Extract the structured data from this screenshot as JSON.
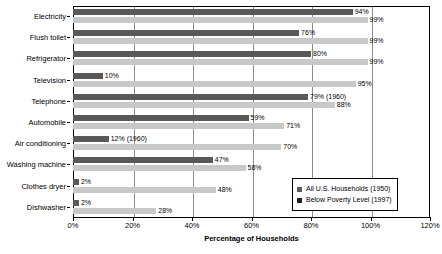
{
  "chart_data": {
    "type": "bar",
    "orientation": "horizontal",
    "title": "",
    "xlabel": "Percentage of Households",
    "ylabel": "",
    "xlim": [
      0,
      120
    ],
    "xticks": [
      "0%",
      "20%",
      "40%",
      "60%",
      "80%",
      "100%",
      "120%"
    ],
    "xtick_values": [
      0,
      20,
      40,
      60,
      80,
      100,
      120
    ],
    "grid": true,
    "legend_position": "bottom-right",
    "categories": [
      "Electricity",
      "Flush toilet",
      "Refrigerator",
      "Television",
      "Telephone",
      "Automobile",
      "Air conditioning",
      "Washing machine",
      "Clothes dryer",
      "Dishwasher"
    ],
    "series": [
      {
        "name": "All U.S. Households (1950)",
        "color": "#595959",
        "values": [
          94,
          76,
          80,
          10,
          79,
          59,
          12,
          47,
          2,
          2
        ],
        "labels": [
          "94%",
          "76%",
          "80%",
          "10%",
          "79% (1960)",
          "59%",
          "12% (1960)",
          "47%",
          "2%",
          "2%"
        ]
      },
      {
        "name": "Below Poverty Level (1997)",
        "color": "#c8c8c8",
        "values": [
          99,
          99,
          99,
          95,
          88,
          71,
          70,
          58,
          48,
          28
        ],
        "labels": [
          "99%",
          "99%",
          "99%",
          "95%",
          "88%",
          "71%",
          "70%",
          "58%",
          "48%",
          "28%"
        ]
      }
    ]
  }
}
